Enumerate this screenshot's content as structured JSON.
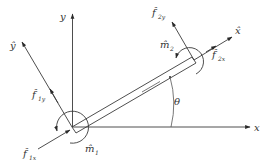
{
  "diagram": {
    "type": "free-body-diagram",
    "colors": {
      "ink": "#3a3a3a",
      "background": "#ffffff"
    },
    "axes": {
      "x": {
        "label": "x"
      },
      "y": {
        "label": "y"
      },
      "x_hat": {
        "label": "x̂"
      },
      "y_hat": {
        "label": "ŷ"
      }
    },
    "angle": {
      "label": "θ"
    },
    "forces": {
      "f1x": {
        "base": "f̂",
        "sub": "1x"
      },
      "f1y": {
        "base": "f̂",
        "sub": "1y"
      },
      "f2x": {
        "base": "f̂",
        "sub": "2x"
      },
      "f2y": {
        "base": "f̂",
        "sub": "2y"
      }
    },
    "moments": {
      "m1": {
        "base": "m̂",
        "sub": "1"
      },
      "m2": {
        "base": "m̂",
        "sub": "2"
      }
    }
  }
}
